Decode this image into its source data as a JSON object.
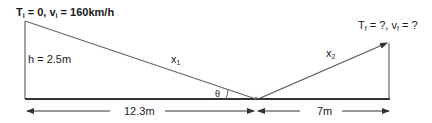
{
  "labels": {
    "initial": {
      "T": "T",
      "T_sub": "i",
      "T_eq": " = 0, ",
      "v": "v",
      "v_sub": "i",
      "v_eq": " = 160km/h"
    },
    "final": {
      "T": "T",
      "T_sub": "f",
      "T_eq": " = ?, ",
      "v": "v",
      "v_sub": "f",
      "v_eq": " = ?"
    },
    "height": "h = 2.5m",
    "x1": "x",
    "x1_sub": "1",
    "x2": "x",
    "x2_sub": "2",
    "theta": "θ",
    "dist_left": "12.3m",
    "dist_right": "7m"
  },
  "colors": {
    "line": "#555555",
    "ground": "#333333",
    "text": "#1a1a1a"
  }
}
